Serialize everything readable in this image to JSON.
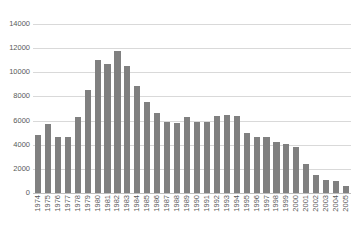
{
  "chart_data": {
    "type": "bar",
    "title": "",
    "subtitle": "",
    "xlabel": "",
    "ylabel": "",
    "ylim": [
      0,
      14000
    ],
    "ytick_interval": 2000,
    "yticks": [
      14000,
      12000,
      10000,
      8000,
      6000,
      4000,
      2000,
      0
    ],
    "ytick_labels": [
      "14000",
      "12000",
      "10000",
      "8000",
      "6000",
      "4000",
      "2000",
      "0"
    ],
    "grid": true,
    "grid_axis": "y",
    "legend": false,
    "legend_position": "none",
    "bar_color": "#808080",
    "grid_color": "#d9d9d9",
    "axis_color": "#bfbfbf",
    "label_color": "#595959",
    "xtick_rotation": -90,
    "categories": [
      "1974",
      "1975",
      "1976",
      "1977",
      "1978",
      "1979",
      "1980",
      "1981",
      "1982",
      "1983",
      "1984",
      "1985",
      "1986",
      "1987",
      "1988",
      "1989",
      "1990",
      "1991",
      "1992",
      "1993",
      "1994",
      "1995",
      "1996",
      "1997",
      "1998",
      "1999",
      "2000",
      "2001",
      "2002",
      "2003",
      "2004",
      "2005"
    ],
    "values": [
      4800,
      5700,
      4600,
      4600,
      6300,
      8500,
      11000,
      10700,
      11800,
      10500,
      8900,
      7500,
      6600,
      5900,
      5800,
      6300,
      5900,
      5900,
      6400,
      6500,
      6400,
      5000,
      4600,
      4600,
      4200,
      4100,
      3800,
      2400,
      1500,
      1100,
      1000,
      600
    ]
  }
}
